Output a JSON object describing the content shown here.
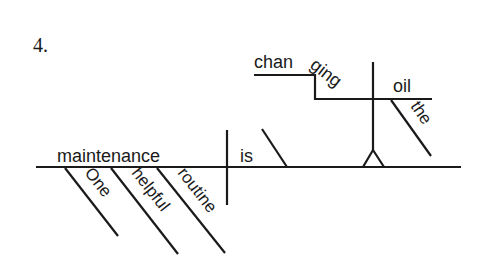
{
  "diagram": {
    "item_number": "4.",
    "sentence_type": "reed-kellogg-sentence-diagram",
    "baseline": {
      "subject": "maintenance",
      "verb": "is",
      "subject_modifiers": [
        "One",
        "helpful",
        "routine"
      ]
    },
    "predicate_nominative_pedestal": {
      "gerund_parts": [
        "chan",
        "ging"
      ],
      "gerund": "changing",
      "object": "oil",
      "object_modifier": "the"
    },
    "colors": {
      "ink": "#1a1a1a",
      "background": "#ffffff"
    }
  }
}
